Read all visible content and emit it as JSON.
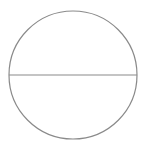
{
  "diagram": {
    "type": "circle-with-diameter",
    "circle": {
      "cx": 73,
      "cy": 75,
      "r": 64,
      "stroke": "#8a8a8a"
    },
    "diameter": {
      "x1": 9,
      "y1": 75,
      "x2": 137,
      "y2": 75,
      "stroke": "#8a8a8a"
    },
    "background": "#ffffff"
  }
}
